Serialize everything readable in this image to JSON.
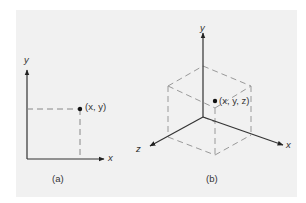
{
  "figure": {
    "panel_a": {
      "caption": "(a)",
      "axis_x_label": "x",
      "axis_y_label": "y",
      "point_label": "(x, y)"
    },
    "panel_b": {
      "caption": "(b)",
      "axis_x_label": "x",
      "axis_y_label": "y",
      "axis_z_label": "z",
      "point_label": "(x, y, z)"
    },
    "colors": {
      "background": "#ffffff",
      "panel": "#f1f1f1",
      "axis": "#333333",
      "dashed": "#888888"
    }
  }
}
